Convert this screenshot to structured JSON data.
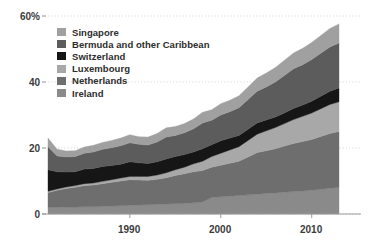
{
  "chart_data": {
    "type": "area",
    "stacked": true,
    "title": "",
    "xlabel": "",
    "ylabel": "",
    "xlim": [
      1981,
      2013
    ],
    "ylim": [
      0,
      60
    ],
    "yticks": [
      0,
      20,
      40,
      60
    ],
    "ytick_labels": [
      "0",
      "20",
      "40",
      "60%"
    ],
    "xticks": [
      1990,
      2000,
      2010
    ],
    "xtick_labels": [
      "1990",
      "2000",
      "2010"
    ],
    "grid": "horizontal-dotted",
    "legend_position": "upper-left",
    "x": [
      1981,
      1982,
      1983,
      1984,
      1985,
      1986,
      1987,
      1988,
      1989,
      1990,
      1991,
      1992,
      1993,
      1994,
      1995,
      1996,
      1997,
      1998,
      1999,
      2000,
      2001,
      2002,
      2003,
      2004,
      2005,
      2006,
      2007,
      2008,
      2009,
      2010,
      2011,
      2012,
      2013
    ],
    "series": [
      {
        "name": "Ireland",
        "color": "#8a8a8a",
        "values": [
          2.0,
          2.0,
          2.1,
          2.1,
          2.2,
          2.2,
          2.3,
          2.4,
          2.5,
          2.6,
          2.7,
          2.8,
          2.9,
          3.0,
          3.1,
          3.2,
          3.4,
          3.6,
          5.0,
          5.2,
          5.4,
          5.6,
          5.8,
          6.0,
          6.2,
          6.4,
          6.6,
          6.8,
          7.0,
          7.2,
          7.5,
          7.8,
          8.0
        ]
      },
      {
        "name": "Netherlands",
        "color": "#6e6e6e",
        "values": [
          4.5,
          5.2,
          5.6,
          6.0,
          6.4,
          6.6,
          6.9,
          7.2,
          7.5,
          7.8,
          7.6,
          7.4,
          7.6,
          8.0,
          8.6,
          9.0,
          9.4,
          9.6,
          9.2,
          9.6,
          10.0,
          10.4,
          11.5,
          12.6,
          13.0,
          13.4,
          14.0,
          14.6,
          15.0,
          15.4,
          16.0,
          16.6,
          17.0
        ]
      },
      {
        "name": "Luxembourg",
        "color": "#a8a8a8",
        "values": [
          0.4,
          0.4,
          0.5,
          0.5,
          0.6,
          0.6,
          0.7,
          0.8,
          0.9,
          1.0,
          1.1,
          1.2,
          1.3,
          1.5,
          1.7,
          2.0,
          2.4,
          2.8,
          3.2,
          3.6,
          4.0,
          4.4,
          5.0,
          5.6,
          6.0,
          6.4,
          6.8,
          7.2,
          7.6,
          8.0,
          8.4,
          8.8,
          9.0
        ]
      },
      {
        "name": "Switzerland",
        "color": "#161616",
        "values": [
          6.5,
          5.2,
          4.5,
          4.2,
          4.4,
          4.4,
          4.5,
          4.3,
          4.2,
          4.4,
          4.1,
          3.9,
          4.0,
          4.2,
          4.0,
          3.8,
          3.6,
          3.8,
          3.6,
          3.8,
          3.6,
          3.4,
          3.4,
          3.4,
          3.3,
          3.2,
          3.2,
          3.4,
          3.4,
          3.6,
          3.8,
          4.0,
          4.2
        ]
      },
      {
        "name": "Bermuda and other Caribbean",
        "color": "#5c5c5c",
        "values": [
          7.0,
          4.8,
          4.6,
          4.6,
          4.8,
          5.0,
          5.2,
          5.4,
          5.6,
          5.8,
          5.6,
          5.6,
          6.0,
          6.6,
          6.4,
          6.6,
          7.0,
          7.8,
          7.4,
          7.8,
          8.0,
          8.4,
          9.0,
          9.6,
          10.0,
          10.6,
          11.4,
          12.0,
          12.2,
          12.6,
          13.0,
          13.4,
          13.6
        ]
      },
      {
        "name": "Singapore",
        "color": "#a0a0a0",
        "values": [
          2.6,
          2.0,
          1.8,
          1.8,
          1.9,
          2.0,
          2.1,
          2.2,
          2.3,
          2.4,
          2.3,
          2.4,
          2.6,
          2.8,
          2.7,
          2.8,
          3.0,
          3.2,
          3.2,
          3.4,
          3.5,
          3.6,
          3.8,
          4.0,
          4.2,
          4.4,
          4.6,
          4.8,
          5.0,
          5.2,
          5.4,
          5.6,
          5.8
        ]
      }
    ],
    "legend_order": [
      "Singapore",
      "Bermuda and other Caribbean",
      "Switzerland",
      "Luxembourg",
      "Netherlands",
      "Ireland"
    ]
  },
  "legend": {
    "items": [
      {
        "label": "Singapore",
        "color": "#a0a0a0"
      },
      {
        "label": "Bermuda and other Caribbean",
        "color": "#5c5c5c"
      },
      {
        "label": "Switzerland",
        "color": "#161616"
      },
      {
        "label": "Luxembourg",
        "color": "#a8a8a8"
      },
      {
        "label": "Netherlands",
        "color": "#6e6e6e"
      },
      {
        "label": "Ireland",
        "color": "#8a8a8a"
      }
    ]
  },
  "axes": {
    "y_tick_labels": [
      "60%",
      "40",
      "20",
      "0"
    ],
    "x_tick_labels": [
      "1990",
      "2000",
      "2010"
    ]
  },
  "style": {
    "background": "#ffffff",
    "grid_color": "#d2d2d2",
    "axis_color": "#9a9a9a",
    "text_color": "#3b3b3b"
  }
}
